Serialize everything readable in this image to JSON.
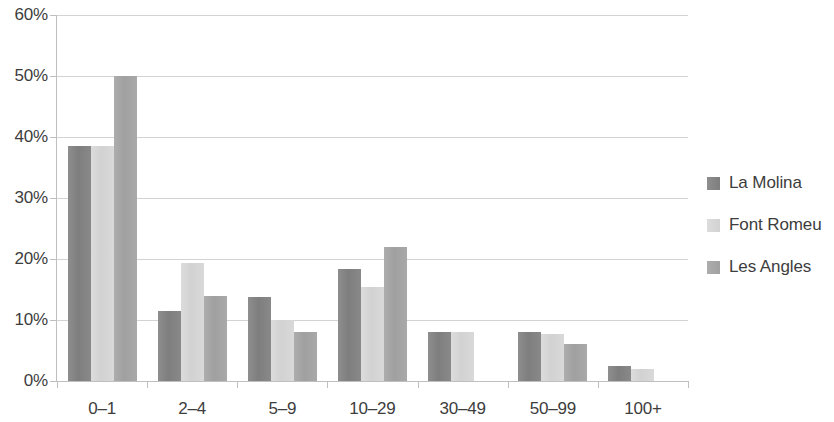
{
  "chart_data": {
    "type": "bar",
    "title": "",
    "subtitle": "",
    "xlabel": "",
    "ylabel": "",
    "categories": [
      "0–1",
      "2–4",
      "5–9",
      "10–29",
      "30–49",
      "50–99",
      "100+"
    ],
    "series": [
      {
        "name": "La Molina",
        "color": "#7e7e7e",
        "values": [
          38.5,
          11.4,
          13.8,
          18.3,
          8.0,
          8.0,
          2.5
        ]
      },
      {
        "name": "Font Romeu",
        "color": "#d2d2d2",
        "values": [
          38.5,
          19.3,
          10.0,
          15.4,
          8.0,
          7.7,
          2.0
        ]
      },
      {
        "name": "Les Angles",
        "color": "#a0a0a0",
        "values": [
          50.0,
          14.0,
          8.0,
          22.0,
          0.0,
          6.0,
          0.0
        ]
      }
    ],
    "ylim": [
      0,
      60
    ],
    "ytick_values": [
      0,
      10,
      20,
      30,
      40,
      50,
      60
    ],
    "ytick_labels": [
      "0%",
      "10%",
      "20%",
      "30%",
      "40%",
      "50%",
      "60%"
    ],
    "grid": true,
    "grid_axis": "y",
    "legend_position": "right",
    "bar_value_suffix": "%"
  },
  "legend": {
    "items": [
      {
        "label": "La Molina"
      },
      {
        "label": "Font Romeu"
      },
      {
        "label": "Les Angles"
      }
    ]
  }
}
